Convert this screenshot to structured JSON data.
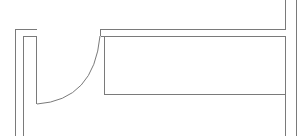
{
  "diagram": {
    "type": "floor-plan-door-detail",
    "background": "#ffffff",
    "stroke_color": "#7a7a7a",
    "elements": {
      "left_wall_outer": "M15.5 136 L15.5 29.5 L36.5 29.5",
      "left_jamb": "M23.5 136 L23.5 36.5 L36.5 36.5 L36.5 104",
      "door_swing_arc": "M37 104 Q94 100 100 36",
      "door_leaf": "M36.5 104 L37 104",
      "top_wall_upper": "M100.5 36 L100.5 29.5 L285.5 29.5 L285.5 0",
      "top_wall_lower": "M100.5 36.5 L285.5 36.5",
      "inner_panel": "M104.5 36.5 L104.5 94.5 L285.5 94.5",
      "right_wall_inner": "M285.5 36.5 L285.5 136",
      "right_wall_outer": "M296.5 0 L296.5 136"
    }
  }
}
